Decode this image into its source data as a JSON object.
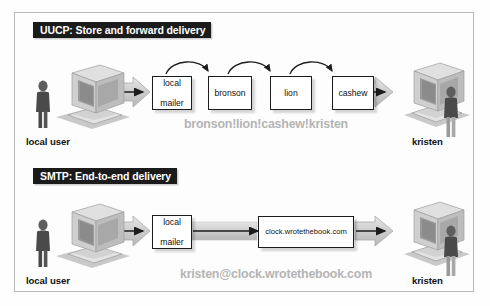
{
  "figure": {
    "type": "diagram",
    "title_visible": false,
    "background_color": "#fdfdfd",
    "frame_color": "#b9b9b9"
  },
  "sections": [
    {
      "id": "uucp",
      "banner": "UUCP: Store and forward delivery",
      "banner_bg": "#1b1b1b",
      "banner_fg": "#ffffff",
      "source": {
        "label": "local user",
        "icon": "desktop-computer-icon",
        "person": "user-figure-icon"
      },
      "destination": {
        "label": "kristen",
        "icon": "desktop-computer-icon",
        "person": "user-figure-icon"
      },
      "nodes": [
        {
          "id": "local-mailer",
          "line1": "local",
          "line2": "mailer"
        },
        {
          "id": "bronson",
          "line1": "bronson",
          "line2": ""
        },
        {
          "id": "lion",
          "line1": "lion",
          "line2": ""
        },
        {
          "id": "cashew",
          "line1": "cashew",
          "line2": ""
        }
      ],
      "hops": [
        "local mailer",
        "bronson",
        "lion",
        "cashew"
      ],
      "annotation": "bronson!lion!cashew!kristen",
      "annotation_color": "#b4b4b4"
    },
    {
      "id": "smtp",
      "banner": "SMTP: End-to-end delivery",
      "banner_bg": "#1b1b1b",
      "banner_fg": "#ffffff",
      "source": {
        "label": "local user",
        "icon": "desktop-computer-icon",
        "person": "user-figure-icon"
      },
      "destination": {
        "label": "kristen",
        "icon": "desktop-computer-icon",
        "person": "user-figure-icon"
      },
      "nodes": [
        {
          "id": "local-mailer",
          "line1": "local",
          "line2": "mailer"
        },
        {
          "id": "clock-host",
          "line1": "clock.wrotethebook.com",
          "line2": ""
        }
      ],
      "hops": [
        "local mailer",
        "clock.wrotethebook.com"
      ],
      "annotation": "kristen@clock.wrotethebook.com",
      "annotation_color": "#b4b4b4"
    }
  ]
}
